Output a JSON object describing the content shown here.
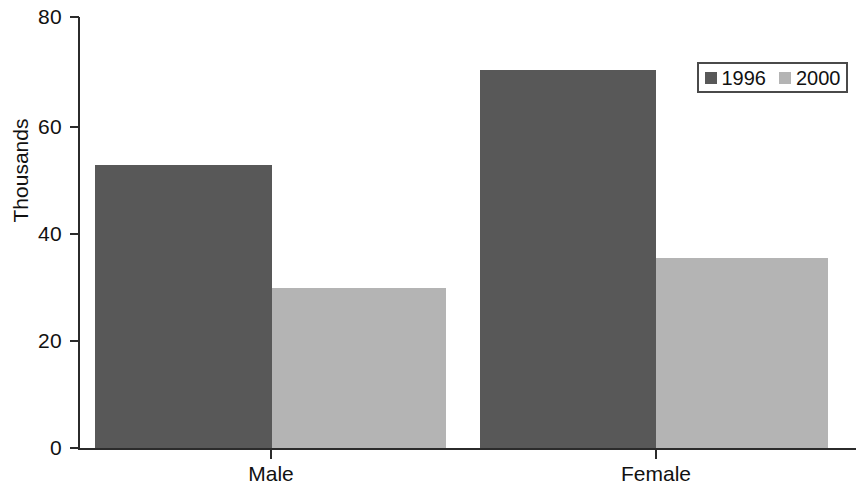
{
  "chart_data": {
    "type": "bar",
    "title": "",
    "subtitle": "",
    "xlabel": "",
    "ylabel": "Thousands",
    "categories": [
      "Male",
      "Female"
    ],
    "series": [
      {
        "name": "1996",
        "values": [
          52.5,
          70.2
        ],
        "color": "#585858"
      },
      {
        "name": "2000",
        "values": [
          29.7,
          35.4
        ],
        "color": "#b4b4b4"
      }
    ],
    "ylim": [
      0,
      80
    ],
    "yticks": [
      0,
      20,
      40,
      60,
      80
    ],
    "ytick_labels": [
      "0",
      "20",
      "40",
      "60",
      "80"
    ],
    "grid": false,
    "legend_position": "top-right",
    "legend_entries": [
      "1996",
      "2000"
    ],
    "annotations": []
  },
  "axes": {
    "y_label": "Thousands",
    "y_ticks": [
      {
        "value": "80",
        "pos": 17
      },
      {
        "value": "60",
        "pos": 127
      },
      {
        "value": "40",
        "pos": 234
      },
      {
        "value": "20",
        "pos": 341
      },
      {
        "value": "0",
        "pos": 448
      }
    ],
    "x_ticks": [
      {
        "label": "Male",
        "pos": 271
      },
      {
        "label": "Female",
        "pos": 656
      }
    ]
  },
  "bars": [
    {
      "name": "male-1996",
      "group": "Male",
      "series": "1996",
      "value": 52.5,
      "left": 95,
      "width": 177,
      "height": 283,
      "color": "#585858"
    },
    {
      "name": "male-2000",
      "group": "Male",
      "series": "2000",
      "value": 29.7,
      "left": 272,
      "width": 174,
      "height": 160,
      "color": "#b4b4b4"
    },
    {
      "name": "female-1996",
      "group": "Female",
      "series": "1996",
      "value": 70.2,
      "left": 480,
      "width": 176,
      "height": 378,
      "color": "#585858"
    },
    {
      "name": "female-2000",
      "group": "Female",
      "series": "2000",
      "value": 35.4,
      "left": 656,
      "width": 172,
      "height": 190,
      "color": "#b4b4b4"
    }
  ],
  "legend": {
    "items": [
      {
        "label": "1996",
        "color": "#585858"
      },
      {
        "label": "2000",
        "color": "#b4b4b4"
      }
    ]
  }
}
